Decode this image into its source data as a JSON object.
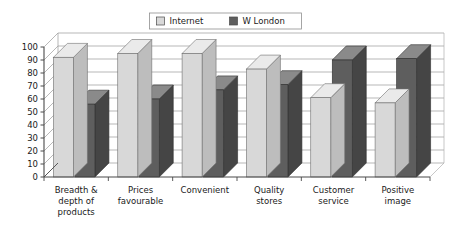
{
  "chart_data": {
    "type": "bar",
    "title": "",
    "subtitle": "",
    "xlabel": "",
    "ylabel": "",
    "ylim": [
      0,
      100
    ],
    "ytick_step": 10,
    "yticks": [
      "0",
      "10",
      "20",
      "30",
      "40",
      "50",
      "60",
      "70",
      "80",
      "90",
      "100"
    ],
    "grid": true,
    "three_d": true,
    "legend_position": "top-center",
    "categories": [
      "Breadth & depth of products",
      "Prices favourable",
      "Convenient",
      "Quality stores",
      "Customer service",
      "Positive image"
    ],
    "category_lines": [
      [
        "Breadth &",
        "depth of",
        "products"
      ],
      [
        "Prices",
        "favourable"
      ],
      [
        "Convenient"
      ],
      [
        "Quality",
        "stores"
      ],
      [
        "Customer",
        "service"
      ],
      [
        "Positive",
        "image"
      ]
    ],
    "series": [
      {
        "name": "Internet",
        "color": "#d8d8d8",
        "values": [
          92,
          95,
          95,
          83,
          61,
          57
        ]
      },
      {
        "name": "W London",
        "color": "#5e5e5e",
        "values": [
          56,
          60,
          67,
          71,
          90,
          91
        ]
      }
    ]
  },
  "legend": {
    "items": [
      {
        "label": "Internet",
        "swatch": "#d8d8d8"
      },
      {
        "label": "W London",
        "swatch": "#5e5e5e"
      }
    ]
  },
  "colors": {
    "series_light_face": "#d8d8d8",
    "series_light_top": "#eaeaea",
    "series_light_side": "#bdbdbd",
    "series_dark_face": "#5e5e5e",
    "series_dark_top": "#8a8a8a",
    "series_dark_side": "#454545",
    "gridline": "#9a9a9a",
    "axis": "#4a4a4a",
    "plot_border": "#b0b0b0",
    "text": "#1a1a1a",
    "background": "#ffffff"
  }
}
